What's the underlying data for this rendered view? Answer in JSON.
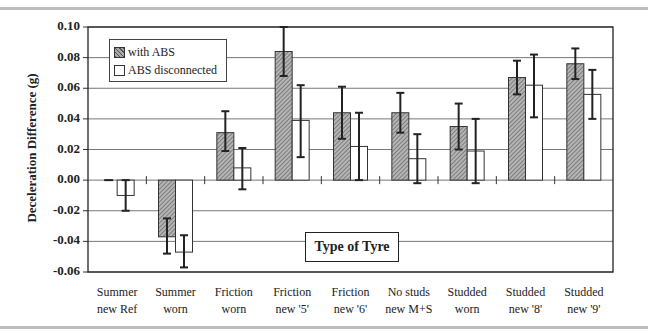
{
  "chart_data": {
    "type": "bar",
    "title": "",
    "xlabel": "Type of Tyre",
    "ylabel": "Deceleration Difference (g)",
    "ylim": [
      -0.06,
      0.1
    ],
    "yticks": [
      "0.10",
      "0.08",
      "0.06",
      "0.04",
      "0.02",
      "0.00",
      "-0.02",
      "-0.04",
      "-0.06"
    ],
    "grid": true,
    "legend_position": "upper left",
    "categories": [
      [
        "Summer",
        "new Ref"
      ],
      [
        "Summer",
        "worn"
      ],
      [
        "Friction",
        "worn"
      ],
      [
        "Friction",
        "new '5'"
      ],
      [
        "Friction",
        "new '6'"
      ],
      [
        "No studs",
        "new M+S"
      ],
      [
        "Studded",
        "worn"
      ],
      [
        "Studded",
        "new '8'"
      ],
      [
        "Studded",
        "new '9'"
      ]
    ],
    "series": [
      {
        "name": "with ABS",
        "style": "hatched",
        "values": [
          0.0,
          -0.037,
          0.031,
          0.084,
          0.044,
          0.044,
          0.035,
          0.067,
          0.076
        ],
        "err_low": [
          0.0,
          -0.048,
          0.019,
          0.068,
          0.027,
          0.031,
          0.02,
          0.056,
          0.066
        ],
        "err_high": [
          0.0,
          -0.025,
          0.045,
          0.1,
          0.061,
          0.057,
          0.05,
          0.078,
          0.086
        ]
      },
      {
        "name": "ABS disconnected",
        "style": "open",
        "values": [
          -0.01,
          -0.047,
          0.008,
          0.039,
          0.022,
          0.014,
          0.019,
          0.062,
          0.056
        ],
        "err_low": [
          -0.02,
          -0.057,
          -0.006,
          0.015,
          0.0,
          -0.002,
          -0.002,
          0.041,
          0.04
        ],
        "err_high": [
          0.0,
          -0.036,
          0.021,
          0.062,
          0.044,
          0.03,
          0.04,
          0.082,
          0.072
        ]
      }
    ]
  },
  "legend": {
    "item1": "with ABS",
    "item2": "ABS disconnected"
  },
  "axis_title_box": "Type of Tyre",
  "y_axis_label": "Deceleration Difference (g)"
}
